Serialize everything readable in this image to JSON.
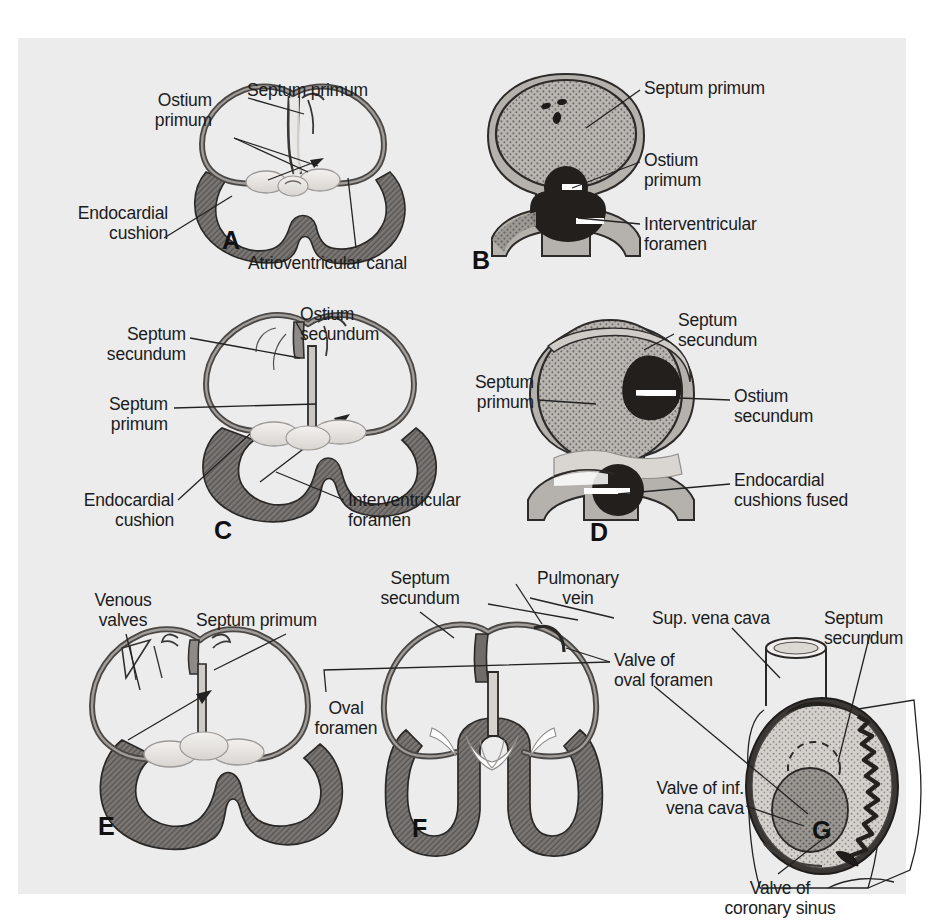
{
  "figure": {
    "background_color": "#ececed",
    "ink_color": "#1b1b1b",
    "myocardium_color": "#6e6a68",
    "cushion_color": "#e6e4e0",
    "septum_shade_color": "#8b8887",
    "dark_fill_color": "#262422"
  },
  "panels": [
    {
      "id": "A",
      "letter": "A",
      "view": "coronal-section",
      "labels": [
        {
          "key": "ostium_primum",
          "text": "Ostium\nprimum"
        },
        {
          "key": "septum_primum",
          "text": "Septum primum"
        },
        {
          "key": "endocardial_cushion",
          "text": "Endocardial\ncushion"
        },
        {
          "key": "atrioventricular_canal",
          "text": "Atrioventricular canal"
        }
      ]
    },
    {
      "id": "B",
      "letter": "B",
      "view": "sagittal-section",
      "labels": [
        {
          "key": "septum_primum",
          "text": "Septum primum"
        },
        {
          "key": "ostium_primum",
          "text": "Ostium\nprimum"
        },
        {
          "key": "interventricular_foramen",
          "text": "Interventricular\nforamen"
        }
      ]
    },
    {
      "id": "C",
      "letter": "C",
      "view": "coronal-section",
      "labels": [
        {
          "key": "septum_secundum",
          "text": "Septum\nsecundum"
        },
        {
          "key": "ostium_secundum",
          "text": "Ostium\nsecundum"
        },
        {
          "key": "septum_primum",
          "text": "Septum\nprimum"
        },
        {
          "key": "endocardial_cushion",
          "text": "Endocardial\ncushion"
        },
        {
          "key": "interventricular_foramen",
          "text": "Interventricular\nforamen"
        }
      ]
    },
    {
      "id": "D",
      "letter": "D",
      "view": "sagittal-section",
      "labels": [
        {
          "key": "septum_secundum",
          "text": "Septum\nsecundum"
        },
        {
          "key": "septum_primum",
          "text": "Septum\nprimum"
        },
        {
          "key": "ostium_secundum",
          "text": "Ostium\nsecundum"
        },
        {
          "key": "endocardial_cushions_fused",
          "text": "Endocardial\ncushions fused"
        }
      ]
    },
    {
      "id": "E",
      "letter": "E",
      "view": "coronal-section",
      "labels": [
        {
          "key": "venous_valves",
          "text": "Venous\nvalves"
        },
        {
          "key": "septum_primum",
          "text": "Septum primum"
        }
      ]
    },
    {
      "id": "F",
      "letter": "F",
      "view": "coronal-section",
      "labels": [
        {
          "key": "septum_secundum",
          "text": "Septum\nsecundum"
        },
        {
          "key": "pulmonary_vein",
          "text": "Pulmonary\nvein"
        },
        {
          "key": "oval_foramen",
          "text": "Oval\nforamen"
        },
        {
          "key": "valve_of_oval_foramen",
          "text": "Valve of\noval foramen"
        }
      ]
    },
    {
      "id": "G",
      "letter": "G",
      "view": "right-atrium-interior",
      "labels": [
        {
          "key": "sup_vena_cava",
          "text": "Sup. vena cava"
        },
        {
          "key": "septum_secundum",
          "text": "Septum\nsecundum"
        },
        {
          "key": "valve_of_inf_vena_cava",
          "text": "Valve of inf.\nvena cava"
        },
        {
          "key": "valve_of_coronary_sinus",
          "text": "Valve of\ncoronary sinus"
        }
      ]
    }
  ],
  "text": {
    "ostium_primum": "Ostium\nprimum",
    "septum_primum": "Septum primum",
    "septum_primum_2l": "Septum\nprimum",
    "endocardial_cushion": "Endocardial\ncushion",
    "atrioventricular_canal": "Atrioventricular canal",
    "interventricular_foramen": "Interventricular\nforamen",
    "septum_secundum": "Septum\nsecundum",
    "ostium_secundum": "Ostium\nsecundum",
    "endocardial_cushions_fused": "Endocardial\ncushions fused",
    "venous_valves": "Venous\nvalves",
    "pulmonary_vein": "Pulmonary\nvein",
    "oval_foramen": "Oval\nforamen",
    "valve_of_oval_foramen": "Valve of\noval foramen",
    "sup_vena_cava": "Sup. vena cava",
    "valve_of_inf_vena_cava": "Valve of inf.\nvena cava",
    "valve_of_coronary_sinus": "Valve of\ncoronary sinus",
    "letter_a": "A",
    "letter_b": "B",
    "letter_c": "C",
    "letter_d": "D",
    "letter_e": "E",
    "letter_f": "F",
    "letter_g": "G"
  }
}
